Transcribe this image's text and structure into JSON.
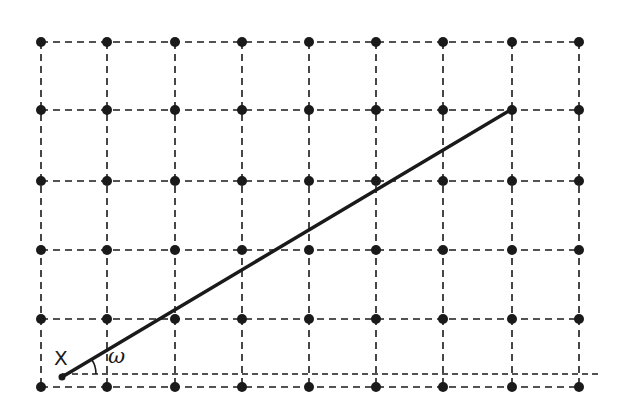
{
  "diagram": {
    "type": "lattice-grid-with-line",
    "grid": {
      "columns_x": [
        41,
        107,
        175,
        242,
        309,
        376,
        443,
        512,
        579
      ],
      "rows_y": [
        42,
        110,
        181,
        250,
        319,
        387
      ],
      "dot_radius": 5,
      "line_style": "dashed",
      "color": "#1a1a1a"
    },
    "segment": {
      "start": [
        62,
        377
      ],
      "end": [
        512,
        109
      ],
      "width": 3.5,
      "color": "#1a1a1a"
    },
    "baseline": {
      "start": [
        62,
        374
      ],
      "end": [
        598,
        374
      ],
      "style": "dashed"
    },
    "labels": {
      "start_point": "X",
      "angle": "ω"
    }
  }
}
